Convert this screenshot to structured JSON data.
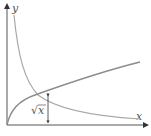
{
  "diagram": {
    "axes": {
      "x_label": "x",
      "y_label": "y",
      "color": "#555555"
    },
    "curves": [
      {
        "name": "square-root",
        "expression": "y = √x",
        "color": "#8c8c8c"
      },
      {
        "name": "reciprocal",
        "expression": "y = 1/x",
        "color": "#a8a8a8"
      }
    ],
    "annotation": {
      "label": "√x",
      "radicand": "x",
      "radical": "√",
      "kind": "vertical double-headed arrow"
    }
  }
}
